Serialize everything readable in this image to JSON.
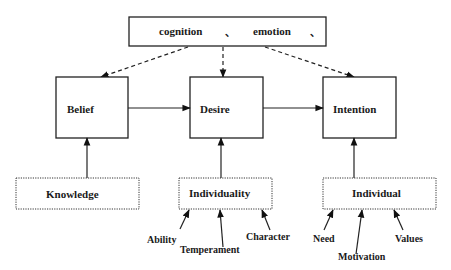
{
  "diagram": {
    "top_box": {
      "label_1": "cognition",
      "separator_1": "、",
      "label_2": "emotion",
      "separator_2": "、"
    },
    "nodes": {
      "belief": {
        "label": "Belief"
      },
      "desire": {
        "label": "Desire"
      },
      "intention": {
        "label": "Intention"
      },
      "knowledge": {
        "label": "Knowledge"
      },
      "individuality": {
        "label": "Individuality"
      },
      "individual": {
        "label": "Individual"
      }
    },
    "influences": {
      "individuality": [
        "Ability",
        "Temperament",
        "Character"
      ],
      "individual": [
        "Need",
        "Motivation",
        "Values"
      ]
    },
    "edges": [
      {
        "from": "top_box",
        "to": "belief",
        "style": "dashed"
      },
      {
        "from": "top_box",
        "to": "desire",
        "style": "dashed"
      },
      {
        "from": "top_box",
        "to": "intention",
        "style": "dashed"
      },
      {
        "from": "belief",
        "to": "desire",
        "style": "solid"
      },
      {
        "from": "desire",
        "to": "intention",
        "style": "solid"
      },
      {
        "from": "knowledge",
        "to": "belief",
        "style": "solid"
      },
      {
        "from": "individuality",
        "to": "desire",
        "style": "solid"
      },
      {
        "from": "individual",
        "to": "intention",
        "style": "solid"
      },
      {
        "from": "Ability",
        "to": "individuality",
        "style": "solid"
      },
      {
        "from": "Temperament",
        "to": "individuality",
        "style": "solid"
      },
      {
        "from": "Character",
        "to": "individuality",
        "style": "solid"
      },
      {
        "from": "Need",
        "to": "individual",
        "style": "solid"
      },
      {
        "from": "Motivation",
        "to": "individual",
        "style": "solid"
      },
      {
        "from": "Values",
        "to": "individual",
        "style": "solid"
      }
    ]
  }
}
